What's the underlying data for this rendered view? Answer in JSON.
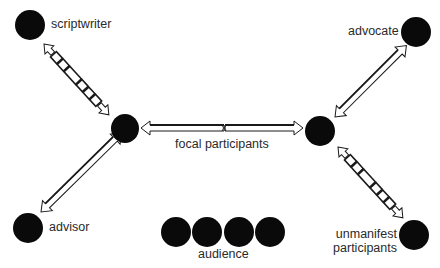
{
  "diagram": {
    "type": "participation-framework",
    "node_color": "#0a0a0a",
    "arrow_stroke": "#1a1a1a",
    "arrow_fill": "#ffffff",
    "label_color": "#2a2a2a",
    "nodes": [
      {
        "id": "scriptwriter",
        "label": "scriptwriter",
        "cx": 30,
        "cy": 25,
        "r": 15
      },
      {
        "id": "focal-left",
        "label": "",
        "cx": 125,
        "cy": 128,
        "r": 14
      },
      {
        "id": "focal-right",
        "label": "",
        "cx": 320,
        "cy": 131,
        "r": 15
      },
      {
        "id": "advocate",
        "label": "advocate",
        "cx": 416,
        "cy": 32,
        "r": 15
      },
      {
        "id": "advisor",
        "label": "advisor",
        "cx": 28,
        "cy": 228,
        "r": 15
      },
      {
        "id": "unmanifest",
        "label": "unmanifest participants",
        "cx": 414,
        "cy": 235,
        "r": 15
      },
      {
        "id": "audience-1",
        "label": "",
        "cx": 176,
        "cy": 232,
        "r": 15
      },
      {
        "id": "audience-2",
        "label": "",
        "cx": 207,
        "cy": 232,
        "r": 15
      },
      {
        "id": "audience-3",
        "label": "",
        "cx": 239,
        "cy": 232,
        "r": 15
      },
      {
        "id": "audience-4",
        "label": "",
        "cx": 270,
        "cy": 232,
        "r": 15
      }
    ],
    "edges": [
      {
        "from": "scriptwriter",
        "to": "focal-left",
        "style": "segmented",
        "double_headed": true
      },
      {
        "from": "focal-left",
        "to": "focal-right",
        "style": "solid",
        "double_headed": true
      },
      {
        "from": "focal-left",
        "to": "advisor",
        "style": "solid",
        "double_headed": true
      },
      {
        "from": "focal-right",
        "to": "advocate",
        "style": "solid",
        "double_headed": true
      },
      {
        "from": "focal-right",
        "to": "unmanifest",
        "style": "segmented",
        "double_headed": true
      }
    ],
    "labels": {
      "scriptwriter": "scriptwriter",
      "advocate": "advocate",
      "advisor": "advisor",
      "focal": "focal participants",
      "unmanifest_line1": "unmanifest",
      "unmanifest_line2": "participants",
      "audience": "audience"
    }
  }
}
